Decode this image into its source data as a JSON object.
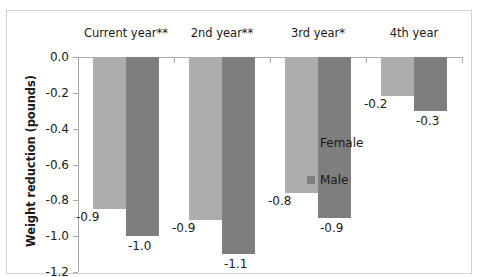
{
  "chart_data": {
    "type": "bar",
    "title": "",
    "xlabel": "",
    "ylabel": "Weight reduction (pounds)",
    "ylim": [
      -1.2,
      0.0
    ],
    "ytick_labels": [
      "0.0",
      "-0.2",
      "-0.4",
      "-0.6",
      "-0.8",
      "-1.0",
      "-1.2"
    ],
    "ytick_values": [
      0.0,
      -0.2,
      -0.4,
      -0.6,
      -0.8,
      -1.0,
      -1.2
    ],
    "grid": false,
    "legend_position": "right",
    "categories": [
      "Current year**",
      "2nd year**",
      "3rd year*",
      "4th year"
    ],
    "series": [
      {
        "name": "Female",
        "color": "#adadad",
        "values": [
          -0.85,
          -0.91,
          -0.76,
          -0.22
        ],
        "labels": [
          "-0.9",
          "-0.9",
          "-0.8",
          "-0.2"
        ]
      },
      {
        "name": "Male",
        "color": "#7e7e7e",
        "values": [
          -1.0,
          -1.1,
          -0.9,
          -0.3
        ],
        "labels": [
          "-1.0",
          "-1.1",
          "-0.9",
          "-0.3"
        ]
      }
    ]
  },
  "legend": {
    "items": [
      {
        "label": "Female",
        "color": "#adadad"
      },
      {
        "label": "Male",
        "color": "#7e7e7e"
      }
    ]
  }
}
